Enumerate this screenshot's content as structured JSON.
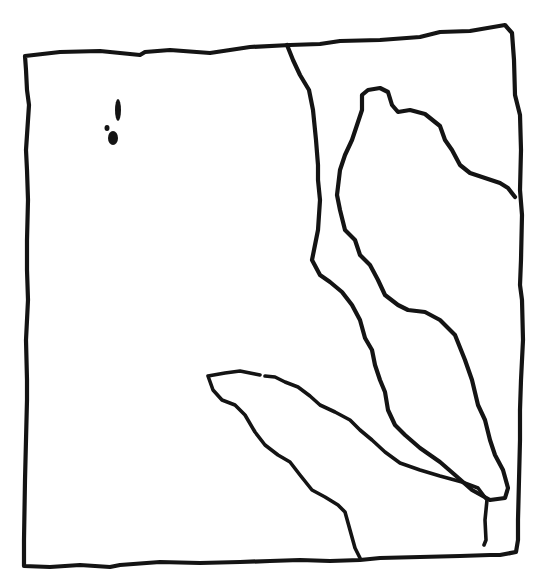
{
  "diagram": {
    "type": "hand-drawn-outline-sketch",
    "canvas": {
      "width": 549,
      "height": 580
    },
    "colors": {
      "background": "#ffffff",
      "ink": "#141414"
    },
    "paths": {
      "outer_border": "M25,56 L60,52 L100,51 L140,55 L145,52 L170,50 L210,53 L250,47 L290,45 L320,44 L340,41 L380,40 L420,37 L440,32 L470,31 L505,25 L512,33 L514,60 L515,95 L520,115 L521,150 L520,190 L522,215 L521,260 L520,285 L522,300 L523,340 L521,380 L520,410 L520,440 L519,480 L518,520 L518,540 L516,552 L500,555 L490,555 L460,556 L420,557 L380,558 L360,560 L330,561 L300,560 L270,561 L240,562 L200,563 L160,562 L120,565 L110,567 L80,565 L50,567 L24,566 L24,540 L25,480 L27,400 L27,380 L26,340 L28,300 L27,270 L27,240 L28,200 L27,170 L26,150 L28,120 L29,105 L27,90 L26,70 Z",
      "upper_divider": "M287,45 L293,60 L300,75 L309,90 L313,110 L316,140 L318,165 L318,180 L320,200 L318,230 L315,245 L312,260 L320,275 L330,282 L342,292 L352,305 L360,320 L365,338 L372,350 L375,365 L380,380 L385,392 L388,410 L395,425 L405,435 L420,448 L440,462 L455,475 L472,490 L490,500 L505,498 L508,488 L503,470 L495,455 L490,440 L485,420 L478,405 L472,380 L465,360 L455,335 L440,320 L425,312 L408,310 L398,305 L385,295 L378,280 L370,265 L360,255 L355,240 L345,230 L340,210 L337,195 L340,170 L345,155 L352,140 L357,125 L362,110 L362,95 L368,90 L380,88 L388,92 L392,105 L398,112 L410,110 L425,114 L440,126 L445,140 L452,150 L460,165 L470,173 L485,178 L500,183 L508,188 L515,197",
      "lower_lobe": "M208,376 L225,373 L240,371 L255,374 L260,375 M265,376 L275,377 L285,382 L298,387 L310,396 L320,405 L335,412 L350,420 L360,430 L372,440 L385,452 L400,463 L420,470 L440,476 L462,482 L478,488 L487,500 L485,520 L486,540 L484,545 M208,376 L213,390 L222,400 L235,405 L245,415 L255,432 L265,445 L278,455 L290,462 L300,475 L312,490 L325,497 L338,505 L345,512 L350,530 L355,548 L360,558"
    },
    "marks": [
      {
        "name": "pencil-mark-upper",
        "cx": 118,
        "cy": 110,
        "rx": 3,
        "ry": 11
      },
      {
        "name": "pencil-mark-lower",
        "cx": 113,
        "cy": 138,
        "rx": 5,
        "ry": 7
      },
      {
        "name": "pencil-dot",
        "cx": 107,
        "cy": 128,
        "rx": 2.5,
        "ry": 3
      }
    ]
  }
}
